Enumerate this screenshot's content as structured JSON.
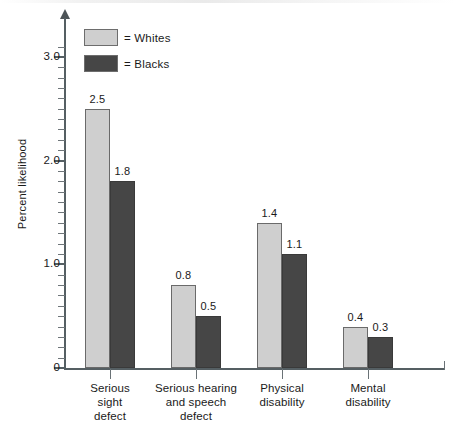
{
  "chart_data": {
    "type": "bar",
    "title": "",
    "subtitle": "",
    "xlabel": "",
    "ylabel": "Percent likelihood",
    "ylim": [
      0,
      3.2
    ],
    "grid": false,
    "legend_position": "top-left",
    "categories": [
      "Serious\nsight\ndefect",
      "Serious hearing\nand speech\ndefect",
      "Physical\ndisability",
      "Mental\ndisability"
    ],
    "series": [
      {
        "name": "Whites",
        "color": "#cfcfcf",
        "values": [
          2.5,
          0.8,
          1.4,
          0.4
        ]
      },
      {
        "name": "Blacks",
        "color": "#464646",
        "values": [
          1.8,
          0.5,
          1.1,
          0.3
        ]
      }
    ],
    "y_ticks_major": [
      "0",
      "1.0",
      "2.0",
      "3.0"
    ],
    "y_tick_values": [
      0,
      1.0,
      2.0,
      3.0
    ],
    "y_minor_tick_step": 0.1
  },
  "axis": {
    "y_title": "Percent likelihood",
    "ticks": [
      {
        "label": "3.0",
        "value": 3.0
      },
      {
        "label": "2.0",
        "value": 2.0
      },
      {
        "label": "1.0",
        "value": 1.0
      },
      {
        "label": "0",
        "value": 0.0
      }
    ]
  },
  "legend": {
    "items": [
      {
        "label": "= Whites",
        "swatch": "#cfcfcf"
      },
      {
        "label": "= Blacks",
        "swatch": "#464646"
      }
    ]
  },
  "groups": [
    {
      "label_lines": [
        "Serious",
        "sight",
        "defect"
      ],
      "bars": [
        {
          "series": "Whites",
          "value": 2.5,
          "value_label": "2.5"
        },
        {
          "series": "Blacks",
          "value": 1.8,
          "value_label": "1.8"
        }
      ]
    },
    {
      "label_lines": [
        "Serious hearing",
        "and speech",
        "defect"
      ],
      "bars": [
        {
          "series": "Whites",
          "value": 0.8,
          "value_label": "0.8"
        },
        {
          "series": "Blacks",
          "value": 0.5,
          "value_label": "0.5"
        }
      ]
    },
    {
      "label_lines": [
        "Physical",
        "disability"
      ],
      "bars": [
        {
          "series": "Whites",
          "value": 1.4,
          "value_label": "1.4"
        },
        {
          "series": "Blacks",
          "value": 1.1,
          "value_label": "1.1"
        }
      ]
    },
    {
      "label_lines": [
        "Mental",
        "disability"
      ],
      "bars": [
        {
          "series": "Whites",
          "value": 0.4,
          "value_label": "0.4"
        },
        {
          "series": "Blacks",
          "value": 0.3,
          "value_label": "0.3"
        }
      ]
    }
  ]
}
